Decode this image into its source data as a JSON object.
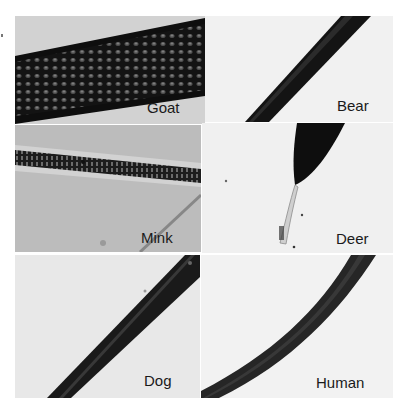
{
  "figure": {
    "panels": [
      {
        "id": "goat",
        "label": "Goat",
        "bg": "#c9c9c9"
      },
      {
        "id": "bear",
        "label": "Bear",
        "bg": "#f1f1f1"
      },
      {
        "id": "mink",
        "label": "Mink",
        "bg": "#b9b9b9"
      },
      {
        "id": "deer",
        "label": "Deer",
        "bg": "#f0f0f0"
      },
      {
        "id": "dog",
        "label": "Dog",
        "bg": "#e9e9e9"
      },
      {
        "id": "human",
        "label": "Human",
        "bg": "#f2f2f2"
      }
    ]
  }
}
